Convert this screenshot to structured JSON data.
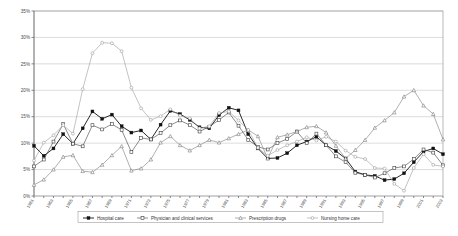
{
  "chart_data": {
    "type": "line",
    "title": "",
    "xlabel": "",
    "ylabel": "",
    "ylim": [
      0,
      35
    ],
    "ytick_labels": [
      "0%",
      "5%",
      "10%",
      "15%",
      "20%",
      "25%",
      "30%",
      "35%"
    ],
    "ytick_values": [
      0,
      5,
      10,
      15,
      20,
      25,
      30,
      35
    ],
    "grid": true,
    "legend_position": "bottom",
    "x": [
      1961,
      1962,
      1963,
      1964,
      1965,
      1966,
      1967,
      1968,
      1969,
      1970,
      1971,
      1972,
      1973,
      1974,
      1975,
      1976,
      1977,
      1978,
      1979,
      1980,
      1981,
      1982,
      1983,
      1984,
      1985,
      1986,
      1987,
      1988,
      1989,
      1990,
      1991,
      1992,
      1993,
      1994,
      1995,
      1996,
      1997,
      1998,
      1999,
      2000,
      2001,
      2002,
      2003
    ],
    "xtick_labels": [
      "1961",
      "1963",
      "1965",
      "1967",
      "1969",
      "1971",
      "1973",
      "1975",
      "1977",
      "1979",
      "1981",
      "1983",
      "1985",
      "1987",
      "1989",
      "1991",
      "1993",
      "1995",
      "1997",
      "1999",
      "2001",
      "2003"
    ],
    "series": [
      {
        "name": "Hospital care",
        "marker": "filled-square",
        "color": "#111111",
        "values": [
          9.5,
          7.6,
          9.0,
          11.7,
          9.9,
          12.8,
          16.0,
          14.6,
          15.4,
          13.2,
          12.0,
          12.4,
          10.7,
          13.5,
          16.1,
          15.5,
          14.4,
          13.0,
          12.8,
          15.3,
          16.7,
          16.2,
          11.7,
          9.0,
          7.1,
          7.2,
          8.1,
          9.6,
          10.3,
          11.2,
          9.6,
          8.5,
          7.1,
          4.6,
          4.0,
          3.8,
          3.0,
          3.2,
          4.3,
          6.4,
          8.4,
          9.0,
          7.9
        ]
      },
      {
        "name": "Physician and clinical services",
        "marker": "open-square",
        "color": "#3f3f3f",
        "values": [
          5.6,
          6.9,
          10.3,
          13.6,
          9.9,
          9.4,
          13.4,
          12.6,
          13.6,
          12.5,
          8.3,
          11.0,
          10.7,
          11.9,
          13.4,
          14.3,
          13.4,
          12.2,
          13.1,
          14.4,
          15.8,
          13.3,
          10.6,
          9.3,
          8.8,
          10.0,
          10.8,
          12.2,
          10.0,
          11.8,
          9.6,
          7.5,
          6.4,
          4.4,
          4.0,
          3.5,
          4.3,
          5.3,
          5.6,
          7.0,
          8.8,
          8.2,
          5.8
        ]
      },
      {
        "name": "Prescription drugs",
        "marker": "open-triangle",
        "color": "#7a7a7a",
        "values": [
          2.1,
          3.1,
          5.0,
          7.4,
          7.7,
          4.7,
          4.5,
          5.9,
          7.7,
          9.4,
          4.8,
          5.2,
          6.9,
          10.1,
          11.3,
          9.6,
          8.6,
          9.6,
          10.6,
          10.1,
          10.9,
          11.7,
          12.5,
          11.3,
          7.1,
          11.1,
          11.6,
          12.2,
          13.0,
          13.2,
          12.0,
          9.5,
          7.1,
          8.7,
          10.6,
          12.9,
          14.3,
          15.8,
          18.8,
          20.0,
          17.1,
          15.5,
          10.7
        ]
      },
      {
        "name": "Nursing home care",
        "marker": "open-circle",
        "color": "#9a9a9a",
        "values": [
          6.7,
          10.1,
          11.5,
          13.4,
          11.8,
          20.2,
          27.0,
          29.0,
          28.9,
          27.4,
          20.5,
          16.6,
          14.4,
          15.1,
          16.4,
          15.2,
          14.7,
          12.8,
          13.2,
          15.7,
          16.0,
          14.3,
          12.5,
          9.1,
          7.6,
          8.7,
          9.6,
          10.3,
          11.1,
          10.5,
          11.2,
          10.3,
          8.6,
          7.4,
          7.0,
          5.3,
          5.2,
          2.3,
          1.0,
          5.3,
          7.9,
          5.9,
          5.6
        ]
      }
    ]
  },
  "legend": {
    "items": [
      {
        "label": "Hospital care"
      },
      {
        "label": "Physician and clinical services"
      },
      {
        "label": "Prescription drugs"
      },
      {
        "label": "Nursing home care"
      }
    ]
  }
}
